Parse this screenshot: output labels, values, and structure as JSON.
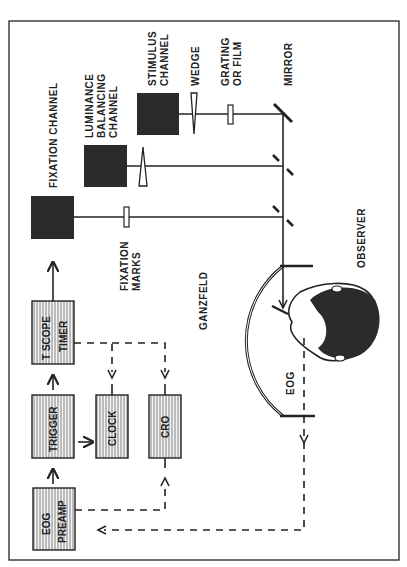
{
  "diagram": {
    "orientation": "rotated-90-ccw",
    "colors": {
      "ink": "#222222",
      "background": "#ffffff",
      "box_fill": "#2b2b2b",
      "hatch": "#555555"
    },
    "light_sources": [
      {
        "id": "fixation",
        "label": "FIXATION CHANNEL"
      },
      {
        "id": "luminance",
        "label_lines": [
          "LUMINANCE",
          "BALANCING",
          "CHANNEL"
        ]
      },
      {
        "id": "stimulus",
        "label_lines": [
          "STIMULUS",
          "CHANNEL"
        ]
      }
    ],
    "optical_labels": {
      "wedge": "WEDGE",
      "grating": [
        "GRATING",
        "OR FILM"
      ],
      "mirror": "MIRROR",
      "fixation_marks": [
        "FIXATION",
        "MARKS"
      ],
      "ganzfeld": "GANZFELD",
      "observer": "OBSERVER",
      "eog": "EOG"
    },
    "electronics": [
      {
        "id": "tscope",
        "label_lines": [
          "T SCOPE",
          "TIMER"
        ]
      },
      {
        "id": "trigger",
        "label_lines": [
          "TRIGGER"
        ]
      },
      {
        "id": "clock",
        "label_lines": [
          "CLOCK"
        ]
      },
      {
        "id": "cro",
        "label_lines": [
          "CRO"
        ]
      },
      {
        "id": "preamp",
        "label_lines": [
          "EOG",
          "PREAMP"
        ]
      }
    ],
    "connections": [
      {
        "from": "EOG PREAMP",
        "to": "TRIGGER",
        "style": "solid"
      },
      {
        "from": "TRIGGER",
        "to": "T SCOPE TIMER",
        "style": "solid"
      },
      {
        "from": "TRIGGER",
        "to": "CLOCK",
        "style": "solid"
      },
      {
        "from": "T SCOPE TIMER",
        "to": "FIXATION CHANNEL",
        "style": "solid"
      },
      {
        "from": "T SCOPE TIMER",
        "to": "CLOCK",
        "style": "dashed"
      },
      {
        "from": "T SCOPE TIMER",
        "to": "CRO",
        "style": "dashed"
      },
      {
        "from": "EOG PREAMP",
        "to": "CRO",
        "style": "dashed"
      },
      {
        "from": "EOG",
        "to": "EOG PREAMP",
        "style": "dashed"
      }
    ]
  }
}
